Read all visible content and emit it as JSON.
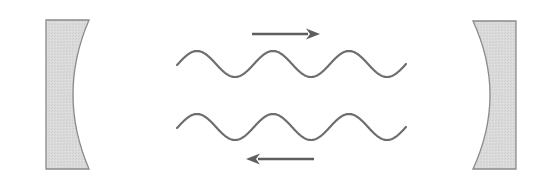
{
  "diagram": {
    "type": "optical-cavity",
    "colors": {
      "background": "#ffffff",
      "mirror_fill": "#d9d9d9",
      "mirror_stroke": "#8a8a8a",
      "wave_stroke": "#6e6e6e",
      "arrow": "#5e5e5e"
    },
    "mirrors": [
      {
        "id": "left-mirror",
        "side": "left",
        "x_outer": 46,
        "x_inner_edge": 89,
        "x_inner_mid": 73,
        "y_top": 20,
        "y_bottom": 169
      },
      {
        "id": "right-mirror",
        "side": "right",
        "x_outer": 516,
        "x_inner_edge": 473,
        "x_inner_mid": 490,
        "y_top": 21,
        "y_bottom": 169
      }
    ],
    "waves": [
      {
        "id": "forward-wave",
        "direction": "right",
        "center_y": 64,
        "amplitude": 13,
        "x_start": 177,
        "x_end": 406,
        "wavelength": 76
      },
      {
        "id": "backward-wave",
        "direction": "left",
        "center_y": 127,
        "amplitude": 13,
        "x_start": 177,
        "x_end": 406,
        "wavelength": 76
      }
    ],
    "arrows": [
      {
        "id": "forward-arrow",
        "direction": "right",
        "x1": 252,
        "x2": 320,
        "y": 34
      },
      {
        "id": "backward-arrow",
        "direction": "left",
        "x1": 314,
        "x2": 246,
        "y": 159
      }
    ]
  }
}
